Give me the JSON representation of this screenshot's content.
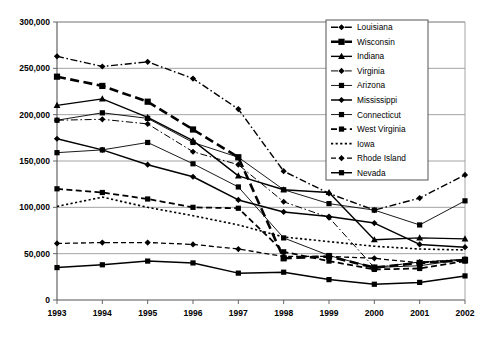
{
  "chart_data": {
    "type": "line",
    "title": "",
    "subtitle": "",
    "xlabel": "",
    "ylabel": "",
    "x": [
      1993,
      1994,
      1995,
      1996,
      1997,
      1998,
      1999,
      2000,
      2001,
      2002
    ],
    "categories": [
      "1993",
      "1994",
      "1995",
      "1996",
      "1997",
      "1998",
      "1999",
      "2000",
      "2001",
      "2002"
    ],
    "xtick_labels": [
      "1993",
      "1994",
      "1995",
      "1996",
      "1997",
      "1998",
      "1999",
      "2000",
      "2001",
      "2002"
    ],
    "ytick_labels": [
      "0",
      "50,000",
      "100,000",
      "150,000",
      "200,000",
      "250,000",
      "300,000"
    ],
    "ytick_values": [
      0,
      50000,
      100000,
      150000,
      200000,
      250000,
      300000
    ],
    "ylim": [
      0,
      300000
    ],
    "grid": "horizontal",
    "legend_position": "top-right",
    "series": [
      {
        "name": "Louisiana",
        "marker": "diamond",
        "linestyle": "dash-dot",
        "linewidth": 1.4,
        "color": "#000000",
        "values": [
          263000,
          252000,
          257000,
          239000,
          206000,
          139000,
          115000,
          97000,
          110000,
          135000
        ]
      },
      {
        "name": "Wisconsin",
        "marker": "square",
        "linestyle": "long-dash",
        "linewidth": 2.6,
        "color": "#000000",
        "values": [
          241000,
          231000,
          214000,
          184000,
          154000,
          45000,
          47000,
          35000,
          40000,
          43000
        ]
      },
      {
        "name": "Indiana",
        "marker": "triangle",
        "linestyle": "solid",
        "linewidth": 1.4,
        "color": "#000000",
        "values": [
          210000,
          217000,
          197000,
          172000,
          134000,
          119000,
          116000,
          65000,
          67000,
          66000
        ]
      },
      {
        "name": "Virginia",
        "marker": "diamond",
        "linestyle": "dash-dot",
        "linewidth": 1.0,
        "color": "#000000",
        "values": [
          194000,
          195000,
          190000,
          160000,
          146000,
          106000,
          89000,
          35000,
          41000,
          44000
        ]
      },
      {
        "name": "Arizona",
        "marker": "square",
        "linestyle": "solid",
        "linewidth": 0.9,
        "color": "#000000",
        "values": [
          194000,
          202000,
          196000,
          170000,
          154000,
          119000,
          104000,
          97000,
          81000,
          107000
        ]
      },
      {
        "name": "Mississippi",
        "marker": "diamond",
        "linestyle": "solid",
        "linewidth": 1.5,
        "color": "#000000",
        "values": [
          174000,
          162000,
          146000,
          133000,
          108000,
          95000,
          90000,
          83000,
          60000,
          57000
        ]
      },
      {
        "name": "Connecticut",
        "marker": "square",
        "linestyle": "solid",
        "linewidth": 0.9,
        "color": "#000000",
        "values": [
          159000,
          162000,
          170000,
          147000,
          122000,
          67000,
          48000,
          35000,
          37000,
          44000
        ]
      },
      {
        "name": "West Virginia",
        "marker": "square",
        "linestyle": "dashed",
        "linewidth": 1.8,
        "color": "#000000",
        "values": [
          120000,
          116000,
          109000,
          100000,
          99000,
          52000,
          42000,
          33000,
          34000,
          42000
        ]
      },
      {
        "name": "Iowa",
        "marker": "none",
        "linestyle": "dotted",
        "linewidth": 1.6,
        "color": "#000000",
        "values": [
          101000,
          111000,
          100000,
          91000,
          81000,
          68000,
          63000,
          58000,
          55000,
          54000
        ]
      },
      {
        "name": "Rhode Island",
        "marker": "diamond",
        "linestyle": "dashed",
        "linewidth": 1.3,
        "color": "#000000",
        "values": [
          61000,
          62000,
          62000,
          60000,
          55000,
          47000,
          47000,
          45000,
          40000,
          43000
        ]
      },
      {
        "name": "Nevada",
        "marker": "square",
        "linestyle": "solid",
        "linewidth": 1.5,
        "color": "#000000",
        "values": [
          35000,
          38000,
          42000,
          40000,
          29000,
          30000,
          22000,
          17000,
          19000,
          26000
        ]
      }
    ]
  }
}
